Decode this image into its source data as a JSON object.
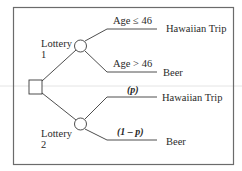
{
  "diagram": {
    "type": "decision-tree",
    "decision_node": {
      "shape": "square"
    },
    "lotteries": [
      {
        "label_line1": "Lottery",
        "label_line2": "1",
        "branches": [
          {
            "condition": "Age ≤ 46",
            "outcome": "Hawaiian Trip"
          },
          {
            "condition": "Age > 46",
            "outcome": "Beer"
          }
        ]
      },
      {
        "label_line1": "Lottery",
        "label_line2": "2",
        "branches": [
          {
            "condition": "(p)",
            "outcome": "Hawaiian Trip"
          },
          {
            "condition": "(1 – p)",
            "outcome": "Beer"
          }
        ]
      }
    ]
  }
}
